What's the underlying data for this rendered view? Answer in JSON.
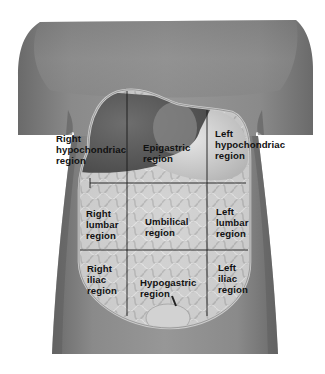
{
  "figure": {
    "grid": {
      "rows": 3,
      "columns": 3
    },
    "colors": {
      "background": "#ffffff",
      "skin_dark": "#6f6f6f",
      "skin_mid": "#8c8c8c",
      "skin_light": "#a8a8a8",
      "cavity_rim": "#c9c9c9",
      "organs_light": "#d8d8d8",
      "grid_line": "#1a1a1a",
      "label_text": "#111111"
    }
  },
  "regions": [
    {
      "id": "right-hypochondriac",
      "row": 1,
      "col": 1,
      "label": "Right\nhypochondriac\nregion"
    },
    {
      "id": "epigastric",
      "row": 1,
      "col": 2,
      "label": "Epigastric\nregion"
    },
    {
      "id": "left-hypochondriac",
      "row": 1,
      "col": 3,
      "label": "Left\nhypochondriac\nregion"
    },
    {
      "id": "right-lumbar",
      "row": 2,
      "col": 1,
      "label": "Right\nlumbar\nregion"
    },
    {
      "id": "umbilical",
      "row": 2,
      "col": 2,
      "label": "Umbilical\nregion"
    },
    {
      "id": "left-lumbar",
      "row": 2,
      "col": 3,
      "label": "Left\nlumbar\nregion"
    },
    {
      "id": "right-iliac",
      "row": 3,
      "col": 1,
      "label": "Right\niliac\nregion"
    },
    {
      "id": "hypogastric",
      "row": 3,
      "col": 2,
      "label": "Hypogastric\nregion"
    },
    {
      "id": "left-iliac",
      "row": 3,
      "col": 3,
      "label": "Left\niliac\nregion"
    }
  ]
}
